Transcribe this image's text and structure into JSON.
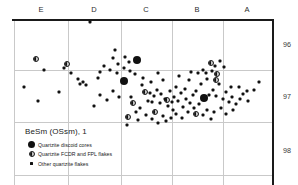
{
  "chart_data": {
    "type": "scatter",
    "title": "BeSm (OSsm), 1",
    "xlabel": "",
    "ylabel": "",
    "x_tick_labels": [
      "E",
      "D",
      "C",
      "B",
      "A"
    ],
    "x_tick_positions": [
      41,
      94,
      146,
      197,
      247
    ],
    "y_tick_labels": [
      "96",
      "97",
      "98"
    ],
    "y_tick_values": [
      96,
      97,
      98
    ],
    "y_tick_positions": [
      44,
      96,
      150
    ],
    "grid": true,
    "grid_vertical_x": [
      14,
      68,
      121,
      172,
      223
    ],
    "grid_horizontal_y": [
      70,
      122,
      175
    ],
    "axis_top_y": 19,
    "axis_right_x": 272,
    "legend_position": "bottom-left",
    "legend": [
      {
        "marker": "large-filled-circle",
        "label": "Quartzite discoid cores"
      },
      {
        "marker": "half-filled-circle",
        "label": "Quartzite FCDR and FPL flakes"
      },
      {
        "marker": "small-filled-square",
        "label": "Other quartzite flakes"
      }
    ],
    "series": [
      {
        "name": "Quartzite discoid cores",
        "marker": "large-filled-circle",
        "size": 8,
        "points": [
          {
            "x": 137,
            "y": 60
          },
          {
            "x": 124,
            "y": 81
          },
          {
            "x": 204,
            "y": 98
          }
        ]
      },
      {
        "name": "Quartzite FCDR and FPL flakes",
        "marker": "half-filled-circle",
        "size": 6,
        "points": [
          {
            "x": 36,
            "y": 59
          },
          {
            "x": 67,
            "y": 64
          },
          {
            "x": 145,
            "y": 92
          },
          {
            "x": 167,
            "y": 100
          },
          {
            "x": 133,
            "y": 103
          },
          {
            "x": 155,
            "y": 112
          },
          {
            "x": 128,
            "y": 117
          },
          {
            "x": 196,
            "y": 114
          },
          {
            "x": 211,
            "y": 63
          },
          {
            "x": 217,
            "y": 74
          },
          {
            "x": 216,
            "y": 80
          }
        ]
      },
      {
        "name": "Other quartzite flakes",
        "marker": "small-filled-square",
        "size": 3,
        "points": [
          {
            "x": 90,
            "y": 22
          },
          {
            "x": 115,
            "y": 50
          },
          {
            "x": 113,
            "y": 58
          },
          {
            "x": 125,
            "y": 57
          },
          {
            "x": 129,
            "y": 62
          },
          {
            "x": 118,
            "y": 64
          },
          {
            "x": 124,
            "y": 68
          },
          {
            "x": 104,
            "y": 66
          },
          {
            "x": 110,
            "y": 70
          },
          {
            "x": 100,
            "y": 72
          },
          {
            "x": 98,
            "y": 78
          },
          {
            "x": 117,
            "y": 73
          },
          {
            "x": 130,
            "y": 71
          },
          {
            "x": 135,
            "y": 74
          },
          {
            "x": 44,
            "y": 70
          },
          {
            "x": 64,
            "y": 68
          },
          {
            "x": 71,
            "y": 73
          },
          {
            "x": 78,
            "y": 79
          },
          {
            "x": 80,
            "y": 84
          },
          {
            "x": 83,
            "y": 82
          },
          {
            "x": 86,
            "y": 85
          },
          {
            "x": 24,
            "y": 87
          },
          {
            "x": 38,
            "y": 101
          },
          {
            "x": 59,
            "y": 92
          },
          {
            "x": 100,
            "y": 95
          },
          {
            "x": 113,
            "y": 91
          },
          {
            "x": 119,
            "y": 97
          },
          {
            "x": 142,
            "y": 85
          },
          {
            "x": 150,
            "y": 93
          },
          {
            "x": 157,
            "y": 90
          },
          {
            "x": 154,
            "y": 96
          },
          {
            "x": 161,
            "y": 94
          },
          {
            "x": 148,
            "y": 101
          },
          {
            "x": 160,
            "y": 103
          },
          {
            "x": 170,
            "y": 91
          },
          {
            "x": 176,
            "y": 87
          },
          {
            "x": 174,
            "y": 97
          },
          {
            "x": 168,
            "y": 106
          },
          {
            "x": 173,
            "y": 110
          },
          {
            "x": 181,
            "y": 93
          },
          {
            "x": 185,
            "y": 89
          },
          {
            "x": 178,
            "y": 101
          },
          {
            "x": 186,
            "y": 99
          },
          {
            "x": 190,
            "y": 103
          },
          {
            "x": 183,
            "y": 107
          },
          {
            "x": 193,
            "y": 95
          },
          {
            "x": 196,
            "y": 91
          },
          {
            "x": 199,
            "y": 104
          },
          {
            "x": 194,
            "y": 108
          },
          {
            "x": 201,
            "y": 84
          },
          {
            "x": 207,
            "y": 79
          },
          {
            "x": 212,
            "y": 71
          },
          {
            "x": 206,
            "y": 73
          },
          {
            "x": 203,
            "y": 70
          },
          {
            "x": 198,
            "y": 73
          },
          {
            "x": 215,
            "y": 66
          },
          {
            "x": 220,
            "y": 61
          },
          {
            "x": 224,
            "y": 67
          },
          {
            "x": 219,
            "y": 84
          },
          {
            "x": 213,
            "y": 90
          },
          {
            "x": 209,
            "y": 95
          },
          {
            "x": 216,
            "y": 96
          },
          {
            "x": 223,
            "y": 99
          },
          {
            "x": 226,
            "y": 92
          },
          {
            "x": 229,
            "y": 102
          },
          {
            "x": 232,
            "y": 97
          },
          {
            "x": 221,
            "y": 108
          },
          {
            "x": 214,
            "y": 112
          },
          {
            "x": 226,
            "y": 114
          },
          {
            "x": 233,
            "y": 110
          },
          {
            "x": 231,
            "y": 87
          },
          {
            "x": 239,
            "y": 87
          },
          {
            "x": 243,
            "y": 94
          },
          {
            "x": 248,
            "y": 101
          },
          {
            "x": 247,
            "y": 91
          },
          {
            "x": 254,
            "y": 90
          },
          {
            "x": 259,
            "y": 82
          },
          {
            "x": 140,
            "y": 108
          },
          {
            "x": 136,
            "y": 112
          },
          {
            "x": 146,
            "y": 115
          },
          {
            "x": 138,
            "y": 120
          },
          {
            "x": 152,
            "y": 119
          },
          {
            "x": 158,
            "y": 123
          },
          {
            "x": 163,
            "y": 116
          },
          {
            "x": 166,
            "y": 121
          },
          {
            "x": 171,
            "y": 118
          },
          {
            "x": 176,
            "y": 114
          },
          {
            "x": 182,
            "y": 118
          },
          {
            "x": 188,
            "y": 112
          },
          {
            "x": 203,
            "y": 115
          },
          {
            "x": 207,
            "y": 110
          },
          {
            "x": 211,
            "y": 119
          },
          {
            "x": 127,
            "y": 125
          },
          {
            "x": 107,
            "y": 100
          },
          {
            "x": 94,
            "y": 106
          },
          {
            "x": 131,
            "y": 97
          },
          {
            "x": 143,
            "y": 78
          },
          {
            "x": 151,
            "y": 82
          },
          {
            "x": 163,
            "y": 80
          },
          {
            "x": 179,
            "y": 76
          },
          {
            "x": 189,
            "y": 80
          },
          {
            "x": 191,
            "y": 72
          },
          {
            "x": 158,
            "y": 73
          },
          {
            "x": 152,
            "y": 102
          },
          {
            "x": 165,
            "y": 99
          },
          {
            "x": 172,
            "y": 102
          },
          {
            "x": 236,
            "y": 104
          },
          {
            "x": 240,
            "y": 99
          }
        ]
      }
    ]
  }
}
